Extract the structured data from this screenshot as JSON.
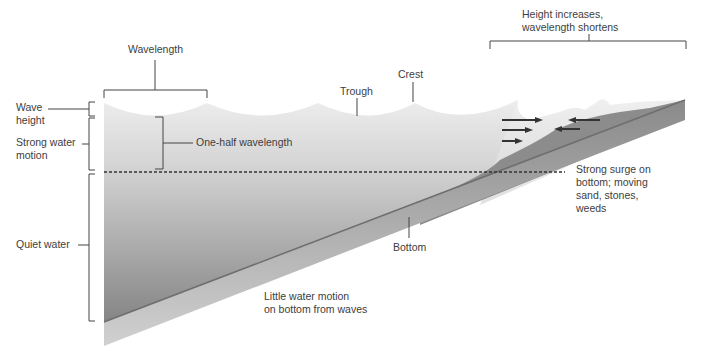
{
  "labels": {
    "wavelength": "Wavelength",
    "trough": "Trough",
    "crest": "Crest",
    "height_increases": "Height increases,\nwavelength shortens",
    "wave_height": "Wave\nheight",
    "strong_water_motion": "Strong water\nmotion",
    "one_half_wavelength": "One-half wavelength",
    "quiet_water": "Quiet water",
    "strong_surge": "Strong surge on\nbottom; moving\nsand, stones,\nweeds",
    "bottom": "Bottom",
    "little_motion": "Little water motion\non bottom from waves"
  },
  "colors": {
    "water_top": "#ececec",
    "water_bottom": "#8a8a8a",
    "seabed_dark": "#7d7d7d",
    "seabed_light": "#c4c4c4",
    "line": "#444444"
  },
  "icons": {
    "arrow_right": "arrow-right-icon",
    "arrow_left": "arrow-left-icon"
  }
}
